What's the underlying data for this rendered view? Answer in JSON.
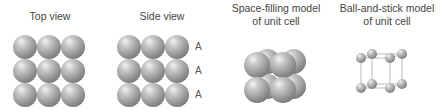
{
  "panels": [
    {
      "title": "Top view"
    },
    {
      "title": "Side view",
      "layer_labels": [
        "A",
        "A",
        "A"
      ]
    },
    {
      "title_line1": "Space-filling model",
      "title_line2": "of unit cell"
    },
    {
      "title_line1": "Ball-and-stick model",
      "title_line2": "of unit cell"
    }
  ],
  "colors": {
    "sphere": "#9a9a9a",
    "text": "#444444",
    "stick": "#bbbbbb"
  }
}
